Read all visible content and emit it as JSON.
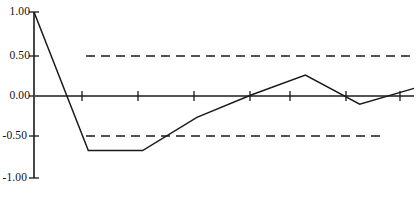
{
  "chart_data": {
    "type": "line",
    "title": "",
    "subtitle": "",
    "xlabel": "",
    "ylabel": "",
    "ylim": [
      -1.0,
      1.0
    ],
    "xlim": [
      0,
      7
    ],
    "grid": false,
    "legend": null,
    "y_ticks": [
      1.0,
      0.5,
      0.0,
      -0.5,
      -1.0
    ],
    "y_tick_labels": [
      "1.00",
      "0.50",
      "0.00",
      "-0.50",
      "-1.00"
    ],
    "x_ticks": [
      0,
      1,
      2,
      3,
      4,
      5,
      6,
      7
    ],
    "x_tick_labels": [
      "",
      "",
      "",
      "",
      "",
      "",
      "",
      ""
    ],
    "x": [
      0,
      1,
      2,
      3,
      4,
      5,
      6,
      7
    ],
    "values": [
      1.0,
      -0.67,
      -0.67,
      -0.27,
      0.0,
      0.24,
      -0.11,
      0.08
    ],
    "series": [
      {
        "name": "autocorrelation",
        "values": [
          1.0,
          -0.67,
          -0.67,
          -0.27,
          0.0,
          0.24,
          -0.11,
          0.08
        ],
        "color": "#1a1a1a",
        "style": "solid"
      }
    ],
    "reference_lines": [
      {
        "name": "upper-confidence-band",
        "value": 0.5,
        "style": "dashed",
        "color": "#1a1a1a"
      },
      {
        "name": "lower-confidence-band",
        "value": -0.5,
        "style": "dashed",
        "color": "#1a1a1a"
      },
      {
        "name": "zero-axis",
        "value": 0.0,
        "style": "solid",
        "color": "#555555"
      }
    ],
    "annotations": []
  },
  "axis": {
    "y_labels": {
      "t1": "1.00",
      "t2": "0.50",
      "t3": "0.00",
      "t4": "-0.50",
      "t5": "-1.00"
    }
  },
  "colors": {
    "background": "#ffffff",
    "line": "#1a1a1a",
    "axis": "#1a1a1a",
    "zero_line": "#555555",
    "dashed_band": "#1a1a1a",
    "text": "#111111"
  }
}
